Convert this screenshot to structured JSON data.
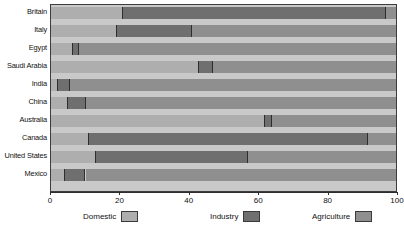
{
  "chart_data": {
    "type": "bar",
    "orientation": "horizontal",
    "stacked": true,
    "title": "",
    "xlabel": "",
    "ylabel": "",
    "xlim": [
      0,
      100
    ],
    "xticks": [
      0,
      20,
      40,
      60,
      80,
      100
    ],
    "xtick_labels": [
      "0",
      "20",
      "40",
      "60",
      "80",
      "100"
    ],
    "grid": false,
    "legend_position": "bottom",
    "categories": [
      "Britain",
      "Italy",
      "Egypt",
      "Saudi Arabia",
      "India",
      "China",
      "Australia",
      "Canada",
      "United States",
      "Mexico"
    ],
    "series": [
      {
        "name": "Domestic",
        "color": "#aeaeae",
        "values": [
          21,
          19,
          6.5,
          43,
          2,
          5,
          62,
          11,
          13,
          4
        ]
      },
      {
        "name": "Industry",
        "color": "#6f6f6f",
        "values": [
          76,
          22,
          1.5,
          4,
          3.5,
          5,
          2,
          81,
          44,
          6
        ]
      },
      {
        "name": "Agriculture",
        "color": "#8f8f8f",
        "values": [
          3,
          59,
          92,
          53,
          94.5,
          90,
          36,
          8,
          43,
          90
        ]
      }
    ]
  },
  "legend": {
    "items": [
      {
        "label": "Domestic",
        "swatch_class": "sw-domestic"
      },
      {
        "label": "Industry",
        "swatch_class": "sw-industry"
      },
      {
        "label": "Agriculture",
        "swatch_class": "sw-agriculture"
      }
    ]
  }
}
